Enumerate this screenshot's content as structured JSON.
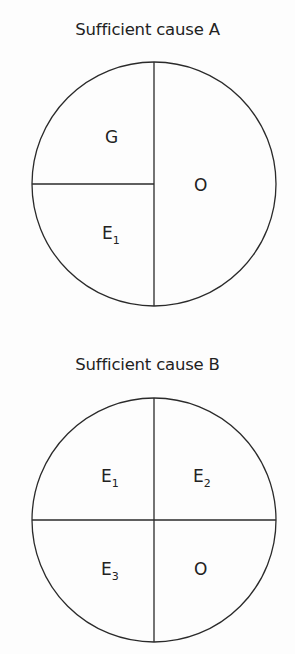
{
  "diagrams": [
    {
      "title": "Sufficient cause A",
      "components": [
        {
          "label": "G",
          "subscript": ""
        },
        {
          "label": "E",
          "subscript": "1"
        },
        {
          "label": "O",
          "subscript": ""
        }
      ]
    },
    {
      "title": "Sufficient cause B",
      "components": [
        {
          "label": "E",
          "subscript": "1"
        },
        {
          "label": "E",
          "subscript": "2"
        },
        {
          "label": "E",
          "subscript": "3"
        },
        {
          "label": "O",
          "subscript": ""
        }
      ]
    }
  ],
  "colors": {
    "line": "#2a2a2a",
    "background": "#fdfdfd"
  }
}
